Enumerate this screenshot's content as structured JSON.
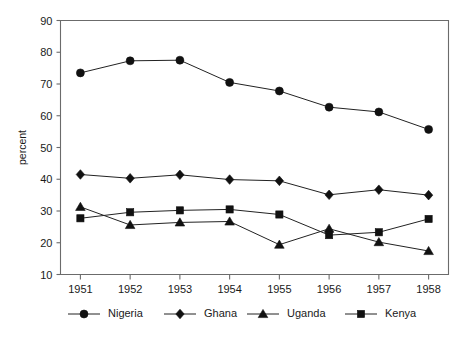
{
  "chart_data": {
    "type": "line",
    "title": "",
    "subtitle": "",
    "xlabel": "",
    "ylabel": "percent",
    "x": [
      1951,
      1952,
      1953,
      1954,
      1955,
      1956,
      1957,
      1958
    ],
    "categories": [
      "1951",
      "1952",
      "1953",
      "1954",
      "1955",
      "1956",
      "1957",
      "1958"
    ],
    "xlim": [
      1950.6,
      1958.4
    ],
    "ylim": [
      10,
      90
    ],
    "yticks": [
      10,
      20,
      30,
      40,
      50,
      60,
      70,
      80,
      90
    ],
    "ytick_labels": [
      "10",
      "20",
      "30",
      "40",
      "50",
      "60",
      "70",
      "80",
      "90"
    ],
    "xticks": [
      1951,
      1952,
      1953,
      1954,
      1955,
      1956,
      1957,
      1958
    ],
    "xtick_labels": [
      "1951",
      "1952",
      "1953",
      "1954",
      "1955",
      "1956",
      "1957",
      "1958"
    ],
    "grid": false,
    "legend_position": "bottom",
    "series": [
      {
        "name": "Nigeria",
        "marker": "circle",
        "color": "#111111",
        "values": [
          73.5,
          77.3,
          77.5,
          70.5,
          67.8,
          62.7,
          61.2,
          55.7
        ]
      },
      {
        "name": "Ghana",
        "marker": "diamond",
        "color": "#111111",
        "values": [
          41.5,
          40.3,
          41.4,
          39.9,
          39.5,
          35.1,
          36.7,
          35.0
        ]
      },
      {
        "name": "Uganda",
        "marker": "triangle",
        "color": "#111111",
        "values": [
          31.3,
          25.6,
          26.4,
          26.7,
          19.4,
          24.4,
          20.2,
          17.4
        ]
      },
      {
        "name": "Kenya",
        "marker": "square",
        "color": "#111111",
        "values": [
          27.7,
          29.6,
          30.2,
          30.5,
          28.9,
          22.4,
          23.3,
          27.5
        ]
      }
    ]
  },
  "legend": {
    "entries": [
      {
        "label": "Nigeria",
        "marker": "circle"
      },
      {
        "label": "Ghana",
        "marker": "diamond"
      },
      {
        "label": "Uganda",
        "marker": "triangle"
      },
      {
        "label": "Kenya",
        "marker": "square"
      }
    ]
  }
}
